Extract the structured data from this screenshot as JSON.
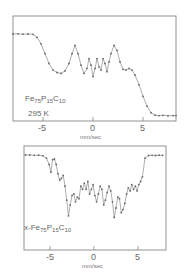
{
  "chart_data": [
    {
      "type": "scatter",
      "title": "",
      "annotation": {
        "compound_prefix": "",
        "base": "Fe",
        "s1": "75",
        "el2": "P",
        "s2": "15",
        "el3": "C",
        "s3": "10",
        "temperature": "295 K"
      },
      "xlabel": "mm/sec",
      "ylabel": "",
      "x_ticks": [
        "-5",
        "0",
        "5"
      ],
      "xlim": [
        -8,
        8.3
      ],
      "grid": false,
      "frame": {
        "x": 13,
        "y": 16,
        "w": 163,
        "h": 105
      },
      "px_per_unit": 10.0,
      "x0_px": 93,
      "series": [
        {
          "name": "Fe75P15C10 amorphous, 295 K",
          "x": [
            -8,
            -7.5,
            -7,
            -6.5,
            -6,
            -5.6,
            -5.2,
            -4.8,
            -4.4,
            -4,
            -3.6,
            -3.2,
            -2.8,
            -2.4,
            -2.1,
            -1.8,
            -1.5,
            -1.2,
            -0.9,
            -0.6,
            -0.4,
            -0.2,
            0,
            0.2,
            0.4,
            0.6,
            0.8,
            1,
            1.2,
            1.4,
            1.6,
            1.8,
            2.1,
            2.4,
            2.7,
            3,
            3.3,
            3.6,
            3.9,
            4.2,
            4.6,
            5,
            5.4,
            5.8,
            6.2,
            6.6,
            7,
            7.5,
            8,
            8.3
          ],
          "y": [
            100,
            100.2,
            99.8,
            100,
            99.6,
            96,
            88,
            76,
            64,
            56,
            53,
            52,
            55,
            64,
            76,
            86,
            76,
            62,
            52,
            58,
            70,
            62,
            48,
            58,
            70,
            60,
            56,
            70,
            64,
            54,
            66,
            76,
            86,
            80,
            66,
            57,
            56,
            58,
            56,
            50,
            38,
            24,
            12,
            4,
            1,
            0.5,
            0.8,
            0.2,
            0.5,
            0.5
          ]
        }
      ]
    },
    {
      "type": "scatter",
      "title": "",
      "annotation": {
        "compound_prefix": "x-",
        "base": "Fe",
        "s1": "75",
        "el2": "P",
        "s2": "15",
        "el3": "C",
        "s3": "10",
        "temperature": ""
      },
      "xlabel": "mm/sec",
      "ylabel": "",
      "x_ticks": [
        "-5",
        "0",
        "5"
      ],
      "xlim": [
        -8,
        8
      ],
      "grid": false,
      "frame": {
        "x": 24,
        "y": 146,
        "w": 142,
        "h": 104
      },
      "px_per_unit": 8.8,
      "x0_px": 94,
      "series": [
        {
          "name": "crystallized Fe75P15C10",
          "x": [
            -7.8,
            -7.3,
            -6.8,
            -6.3,
            -5.8,
            -5.4,
            -5.1,
            -4.9,
            -4.7,
            -4.5,
            -4.3,
            -4.1,
            -3.9,
            -3.7,
            -3.5,
            -3.3,
            -3.1,
            -2.9,
            -2.7,
            -2.5,
            -2.3,
            -2.1,
            -1.9,
            -1.7,
            -1.5,
            -1.3,
            -1.1,
            -0.9,
            -0.7,
            -0.5,
            -0.3,
            -0.1,
            0.1,
            0.3,
            0.5,
            0.7,
            0.9,
            1.1,
            1.3,
            1.5,
            1.7,
            1.9,
            2.1,
            2.3,
            2.5,
            2.7,
            2.9,
            3.1,
            3.3,
            3.5,
            3.7,
            3.9,
            4.1,
            4.3,
            4.5,
            4.7,
            4.9,
            5.1,
            5.3,
            5.5,
            5.8,
            6.2,
            6.6,
            7,
            7.4,
            7.8
          ],
          "y": [
            100,
            100,
            99.6,
            99.8,
            99,
            96,
            88,
            78,
            94,
            95,
            88,
            76,
            68,
            70,
            74,
            60,
            42,
            22,
            36,
            48,
            50,
            40,
            46,
            44,
            60,
            56,
            64,
            56,
            66,
            50,
            56,
            62,
            48,
            40,
            50,
            60,
            56,
            36,
            42,
            52,
            60,
            54,
            40,
            20,
            32,
            46,
            44,
            26,
            30,
            38,
            50,
            58,
            54,
            62,
            56,
            60,
            54,
            62,
            66,
            72,
            96,
            99.4,
            99.6,
            99.4,
            99.8,
            99.6
          ]
        }
      ]
    }
  ]
}
